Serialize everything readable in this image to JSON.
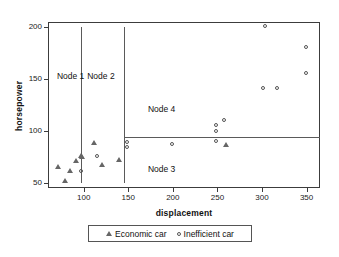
{
  "chart_data": {
    "type": "scatter",
    "title": "",
    "xlabel": "displacement",
    "ylabel": "horsepower",
    "xlim": [
      60,
      365
    ],
    "ylim": [
      45,
      205
    ],
    "xticks": [
      100,
      150,
      200,
      250,
      300,
      350
    ],
    "yticks": [
      50,
      100,
      150,
      200
    ],
    "grid": false,
    "legend_position": "bottom",
    "series": [
      {
        "name": "Economic car",
        "marker": "triangle",
        "points": [
          {
            "x": 71,
            "y": 65
          },
          {
            "x": 79,
            "y": 52
          },
          {
            "x": 85,
            "y": 61
          },
          {
            "x": 91,
            "y": 71
          },
          {
            "x": 97,
            "y": 76
          },
          {
            "x": 98,
            "y": 75
          },
          {
            "x": 112,
            "y": 88
          },
          {
            "x": 120,
            "y": 67
          },
          {
            "x": 140,
            "y": 72
          },
          {
            "x": 260,
            "y": 86
          }
        ]
      },
      {
        "name": "Inefficient car",
        "marker": "circle",
        "points": [
          {
            "x": 98,
            "y": 60
          },
          {
            "x": 116,
            "y": 75
          },
          {
            "x": 150,
            "y": 88
          },
          {
            "x": 150,
            "y": 84
          },
          {
            "x": 200,
            "y": 86
          },
          {
            "x": 249,
            "y": 105
          },
          {
            "x": 249,
            "y": 99
          },
          {
            "x": 249,
            "y": 89
          },
          {
            "x": 259,
            "y": 110
          },
          {
            "x": 302,
            "y": 140
          },
          {
            "x": 318,
            "y": 140
          },
          {
            "x": 305,
            "y": 200
          },
          {
            "x": 350,
            "y": 180
          },
          {
            "x": 350,
            "y": 155
          }
        ]
      }
    ],
    "split_lines": [
      {
        "orientation": "vertical",
        "at": 97,
        "from": 50,
        "to": 200
      },
      {
        "orientation": "vertical",
        "at": 145,
        "from": 50,
        "to": 200
      },
      {
        "orientation": "horizontal",
        "at": 94,
        "from": 145,
        "to": 365
      }
    ],
    "annotations": [
      {
        "label": "Node 1",
        "x": 70,
        "y": 152
      },
      {
        "label": "Node 2",
        "x": 104,
        "y": 152
      },
      {
        "label": "Node 4",
        "x": 172,
        "y": 120
      },
      {
        "label": "Node 3",
        "x": 172,
        "y": 62
      }
    ]
  },
  "legend": {
    "entries": [
      {
        "label": "Economic car",
        "marker": "triangle-marker-icon"
      },
      {
        "label": "Inefficient car",
        "marker": "circle-marker-icon"
      }
    ]
  }
}
